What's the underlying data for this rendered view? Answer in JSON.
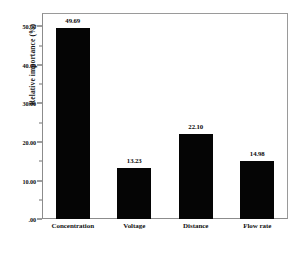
{
  "chart_data": {
    "type": "bar",
    "title": "",
    "xlabel": "",
    "ylabel": "Relative importance (%)",
    "categories": [
      "Concentration",
      "Voltage",
      "Distance",
      "Flow rate"
    ],
    "values": [
      49.69,
      13.23,
      22.1,
      14.98
    ],
    "value_labels": [
      "49.69",
      "13.23",
      "22.10",
      "14.98"
    ],
    "ylim": [
      0,
      53.5
    ],
    "ytick_values": [
      0,
      10,
      20,
      30,
      40,
      50
    ],
    "ytick_labels": [
      ".00",
      "10.00",
      "20.00",
      "30.00",
      "40.00",
      "50.00"
    ],
    "yminor_tick_values": [
      5,
      15,
      25,
      35,
      45
    ],
    "grid": false,
    "legend": null,
    "bar_color": "#050505",
    "frame_color": "#8c8c8c",
    "background": "#ffffff"
  }
}
